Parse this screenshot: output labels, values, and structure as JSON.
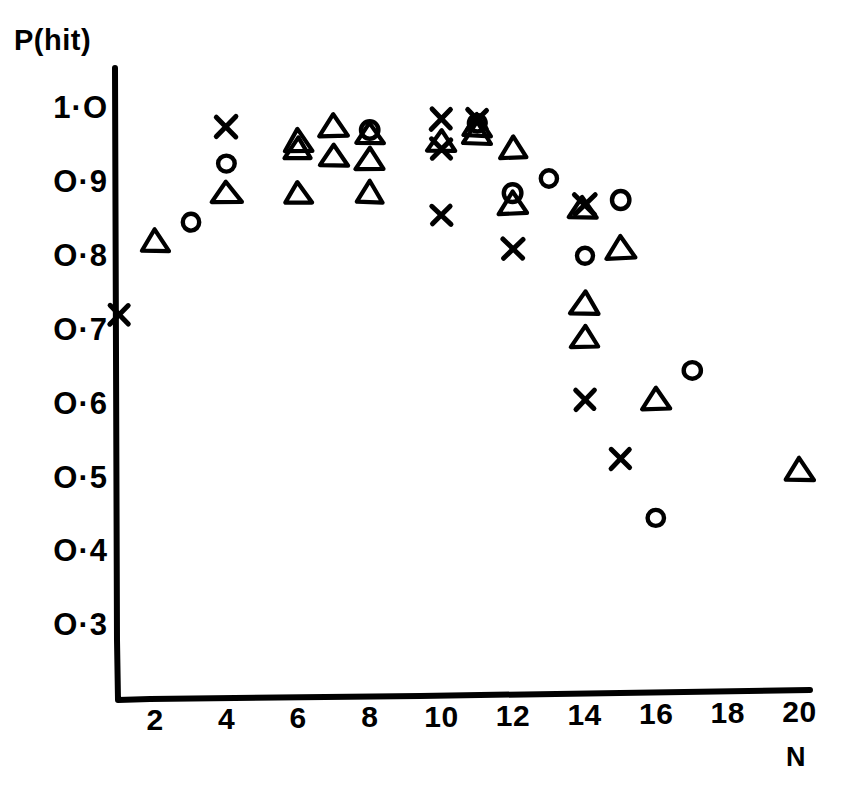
{
  "figure": {
    "background": "#ffffff",
    "ink_color": "#000000",
    "style": "hand-drawn"
  },
  "chart_data": {
    "type": "scatter",
    "title": "",
    "subtitle": "",
    "xlabel": "N",
    "ylabel": "P(hit)",
    "xlim": [
      1,
      20.6
    ],
    "ylim": [
      0.27,
      1.03
    ],
    "xticks": [
      2,
      4,
      6,
      8,
      10,
      12,
      14,
      16,
      18,
      20
    ],
    "xtick_labels": [
      "2",
      "4",
      "6",
      "8",
      "10",
      "12",
      "14",
      "16",
      "18",
      "20"
    ],
    "yticks": [
      1.0,
      0.9,
      0.8,
      0.7,
      0.6,
      0.5,
      0.4,
      0.3
    ],
    "ytick_labels": [
      "1·O",
      "O·9",
      "O·8",
      "O·7",
      "O·6",
      "O·5",
      "O·4",
      "O·3"
    ],
    "grid": false,
    "legend": "none",
    "series": [
      {
        "name": "triangle",
        "marker": "triangle",
        "points": [
          [
            2,
            0.82
          ],
          [
            4,
            0.885
          ],
          [
            6,
            0.955
          ],
          [
            6,
            0.945
          ],
          [
            6,
            0.885
          ],
          [
            7,
            0.975
          ],
          [
            7,
            0.935
          ],
          [
            8,
            0.965
          ],
          [
            8,
            0.93
          ],
          [
            8,
            0.885
          ],
          [
            10,
            0.955
          ],
          [
            11,
            0.975
          ],
          [
            11,
            0.965
          ],
          [
            12,
            0.945
          ],
          [
            12,
            0.87
          ],
          [
            13.95,
            0.865
          ],
          [
            14,
            0.735
          ],
          [
            14,
            0.69
          ],
          [
            15,
            0.81
          ],
          [
            16,
            0.605
          ],
          [
            20,
            0.51
          ]
        ]
      },
      {
        "name": "circle",
        "marker": "circle",
        "points": [
          [
            3,
            0.845
          ],
          [
            4,
            0.925
          ],
          [
            8,
            0.97
          ],
          [
            11,
            0.98
          ],
          [
            12,
            0.885
          ],
          [
            13,
            0.905
          ],
          [
            14,
            0.8
          ],
          [
            15,
            0.875
          ],
          [
            16,
            0.445
          ],
          [
            17,
            0.645
          ]
        ]
      },
      {
        "name": "cross",
        "marker": "cross",
        "points": [
          [
            1,
            0.72
          ],
          [
            4,
            0.975
          ],
          [
            10,
            0.985
          ],
          [
            10,
            0.945
          ],
          [
            10,
            0.855
          ],
          [
            11,
            0.985
          ],
          [
            12,
            0.81
          ],
          [
            14,
            0.87
          ],
          [
            14,
            0.605
          ],
          [
            15,
            0.525
          ]
        ]
      }
    ]
  },
  "axes": {
    "y_axis_title": "P(hit)",
    "x_axis_title": "N"
  }
}
